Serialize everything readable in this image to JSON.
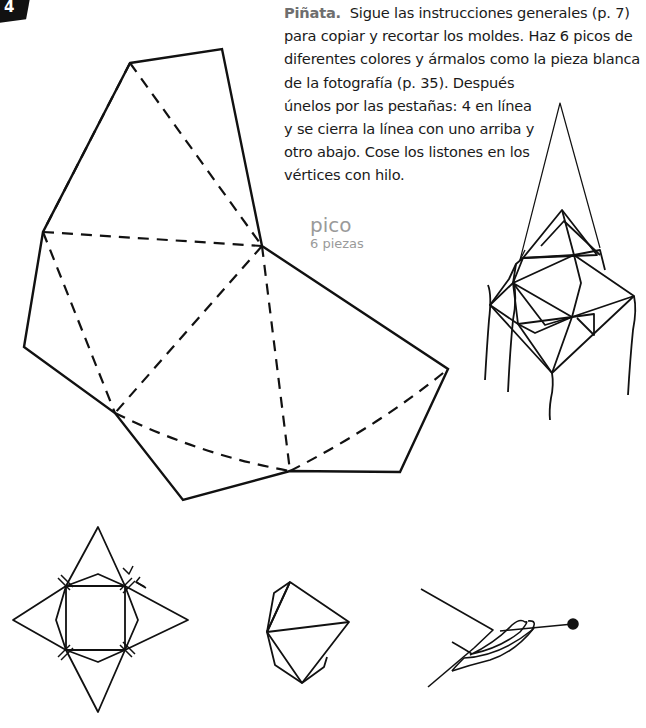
{
  "page": {
    "number": "4"
  },
  "instructions": {
    "title": "Piñata.",
    "lines": [
      "Sigue las instrucciones generales (p. 7)",
      "para copiar y recortar los moldes. Haz 6 picos de",
      "diferentes colores y ármalos como la pieza blanca",
      "de la fotografía (p. 35). Después",
      "únelos por las pestañas: 4 en línea",
      "y se cierra la línea con uno arriba y",
      "otro abajo. Cose los listones en los",
      "vértices con hilo."
    ]
  },
  "template_label": {
    "name": "pico",
    "count": "6 piezas"
  },
  "figures": {
    "template": "pico-pattern",
    "assembled": "pinata-assembled",
    "step1": "folded-star-top-view",
    "step2": "folded-pico-side-view",
    "step3": "needle-and-thread"
  },
  "colors": {
    "ink": "#111111",
    "label_gray": "#9a9a9a",
    "title_gray": "#6e6e6e"
  }
}
